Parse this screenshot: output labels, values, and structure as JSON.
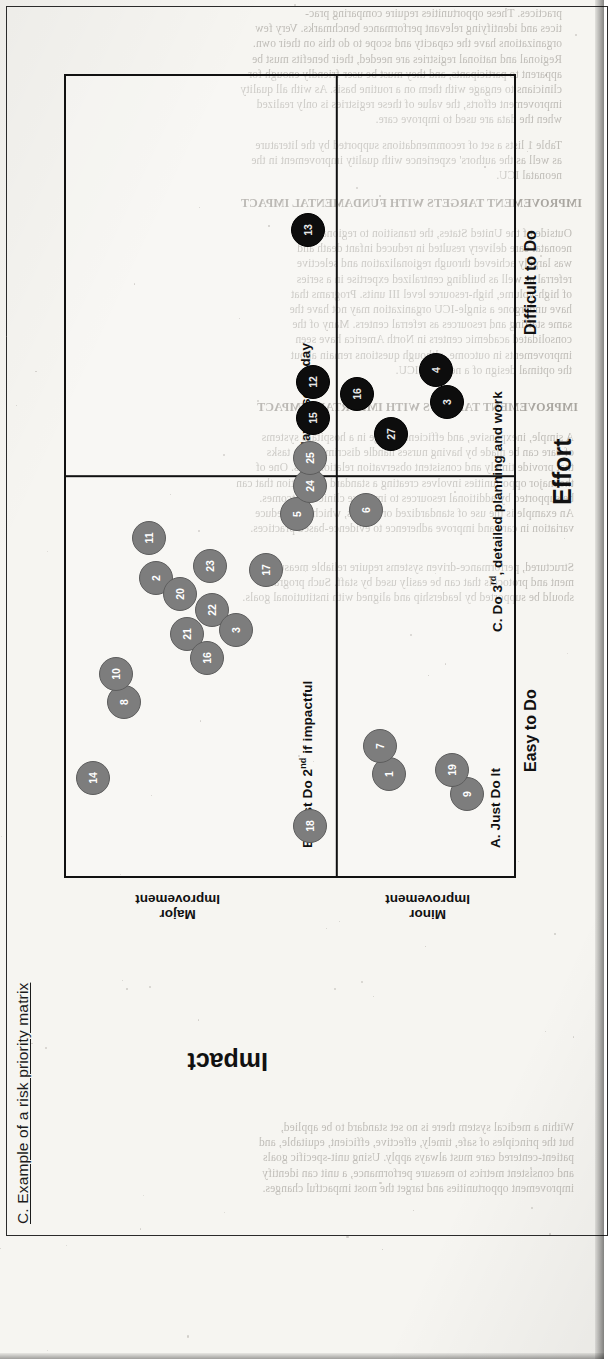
{
  "document": {
    "scan_type": "book-page-scan",
    "caption_prefix": "C.",
    "caption_text": "Example of a risk priority matrix"
  },
  "figure": {
    "caption": "C. Example of a risk priority matrix",
    "x_axis": {
      "title": "Effort",
      "low_label": "Easy to Do",
      "high_label": "Difficult to Do"
    },
    "y_axis": {
      "title": "Impact",
      "high_label_line1": "Major",
      "high_label_line2": "Improvement",
      "low_label_line1": "Minor",
      "low_label_line2": "Improvement"
    },
    "quadrants": [
      {
        "key": "A",
        "label": "A. Just Do It"
      },
      {
        "key": "B",
        "label": "B. Just Do 2",
        "sup": "nd",
        "label_tail": " if impactful"
      },
      {
        "key": "C",
        "label": "C. Do 3",
        "sup": "rd",
        "label_tail": ", detailed planning and work"
      },
      {
        "key": "D",
        "label": "D. Maybe some day"
      }
    ]
  },
  "chart_data": {
    "type": "scatter",
    "title": "C. Example of a risk priority matrix",
    "xlabel": "Effort",
    "ylabel": "Impact",
    "xlim": [
      0,
      100
    ],
    "ylim": [
      0,
      100
    ],
    "grid": false,
    "legend": "none",
    "x_tick_labels": [
      "Easy to Do",
      "Difficult to Do"
    ],
    "y_tick_labels": [
      "Minor Improvement",
      "Major Improvement"
    ],
    "quadrant_labels": {
      "A": "A. Just Do It",
      "B": "B. Just Do 2nd if impactful",
      "C": "C. Do 3rd, detailed planning and work",
      "D": "D. Maybe some day"
    },
    "series": [
      {
        "name": "High impact items",
        "color": "#7d7d7d",
        "points": [
          {
            "label": "18",
            "x": 6.5,
            "y": 45.0
          },
          {
            "label": "1",
            "x": 13.0,
            "y": 27.5
          },
          {
            "label": "7",
            "x": 16.5,
            "y": 29.5
          },
          {
            "label": "9",
            "x": 10.5,
            "y": 10.0
          },
          {
            "label": "19",
            "x": 13.5,
            "y": 13.5
          },
          {
            "label": "14",
            "x": 12.5,
            "y": 93.5
          },
          {
            "label": "8",
            "x": 22.0,
            "y": 86.5
          },
          {
            "label": "10",
            "x": 25.5,
            "y": 88.5
          },
          {
            "label": "2",
            "x": 37.5,
            "y": 79.5
          },
          {
            "label": "11",
            "x": 42.5,
            "y": 81.0
          },
          {
            "label": "20",
            "x": 35.5,
            "y": 74.0
          },
          {
            "label": "21",
            "x": 30.5,
            "y": 72.5
          },
          {
            "label": "16",
            "x": 27.5,
            "y": 68.0
          },
          {
            "label": "22",
            "x": 33.5,
            "y": 67.0
          },
          {
            "label": "23",
            "x": 39.0,
            "y": 67.5
          },
          {
            "label": "3",
            "x": 31.0,
            "y": 61.5
          },
          {
            "label": "17",
            "x": 38.5,
            "y": 55.0
          },
          {
            "label": "5",
            "x": 45.5,
            "y": 48.0
          },
          {
            "label": "24",
            "x": 49.0,
            "y": 45.0
          },
          {
            "label": "25",
            "x": 52.5,
            "y": 45.0
          },
          {
            "label": "6",
            "x": 46.0,
            "y": 32.5
          }
        ]
      },
      {
        "name": "Lower impact items",
        "color": "#0d0d0d",
        "points": [
          {
            "label": "15",
            "x": 57.5,
            "y": 44.5
          },
          {
            "label": "12",
            "x": 62.0,
            "y": 44.5
          },
          {
            "label": "16",
            "x": 60.5,
            "y": 34.5
          },
          {
            "label": "27",
            "x": 55.5,
            "y": 27.0
          },
          {
            "label": "3",
            "x": 59.5,
            "y": 14.5
          },
          {
            "label": "4",
            "x": 63.5,
            "y": 17.0
          },
          {
            "label": "13",
            "x": 81.0,
            "y": 45.5
          }
        ]
      }
    ]
  },
  "bleed_text": {
    "blocks": [
      "practices. These opportunities require comparing prac-\ntices and identifying relevant performance benchmarks. Very few\norganizations have the capacity and scope to do this on their own.\nRegional and national registries are needed, their benefits must be\napparent to participants, and they must be user-friendly enough for\nclinicians to engage with them on a routine basis. As with all quality\nimprovement efforts, the value of these registries is only realized\nwhen the data are used to improve care.",
      "Table 1 lists a set of recommendations supported by the literature\nas well as the authors' experience with quality improvement in the\nneonatal ICU.",
      "IMPROVEMENT TARGETS WITH FUNDAMENTAL IMPACT",
      "Outside of the United States, the transition to regional\nneonatal care delivery resulted in reduced infant death and\nwas largely achieved through regionalization and selective\nreferral as well as building centralized expertise in a series\nof high-volume, high-resource level III units. Programs that\nhave undergone a single-ICU organization may not have the\nsame staffing and resources as referral centers. Many of the\nconsolidated academic centers in North America have seen\nimprovements in outcome, although questions remain about\nthe optimal design of a neonatal ICU.",
      "IMPROVEMENT TARGETS WITH IMPORTANT IMPACT",
      "A simple, inexpensive, and efficient change in a hospital's systems\nof care can be made by having nurses handle discriminative tasks\nthat provide timely and consistent observation relationships. One of\nthe major opportunities involves creating a standard foundation that can\nbe supported by additional resources to improve clinical outcomes.\nAn example is the use of standardized order sets, which help reduce\nvariation in care and improve adherence to evidence-based practices.",
      "Structured, performance-driven systems require reliable measure-\nment and protocols that can be easily used by staff. Such programs\nshould be supported by leadership and aligned with institutional goals.",
      "Within a medical system there is no set standard to be applied,\nbut the principles of safe, timely, effective, efficient, equitable, and\npatient-centered care must always apply. Using unit-specific goals\nand consistent metrics to measure performance, a unit can identify\nimprovement opportunities and target the most impactful changes."
    ]
  }
}
